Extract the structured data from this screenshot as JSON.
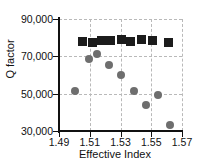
{
  "chart_data": {
    "type": "scatter",
    "title": "",
    "xlabel": "Effective Index",
    "ylabel": "Q factor",
    "xlim": [
      1.49,
      1.57
    ],
    "ylim": [
      30000,
      90000
    ],
    "xticks": [
      "1.49",
      "1.51",
      "1.53",
      "1.55",
      "1.57"
    ],
    "xtick_values": [
      1.49,
      1.51,
      1.53,
      1.55,
      1.57
    ],
    "yticks": [
      "30,000",
      "50,000",
      "70,000",
      "90,000"
    ],
    "ytick_values": [
      30000,
      50000,
      70000,
      90000
    ],
    "grid": true,
    "grid_style": "dashed",
    "legend": "none",
    "series": [
      {
        "name": "square-series",
        "marker": "square",
        "color": "#1c1c1c",
        "points": [
          {
            "x": 1.5055,
            "y": 78000
          },
          {
            "x": 1.5115,
            "y": 77200
          },
          {
            "x": 1.5175,
            "y": 78600
          },
          {
            "x": 1.5235,
            "y": 78400
          },
          {
            "x": 1.5305,
            "y": 79200
          },
          {
            "x": 1.5365,
            "y": 77800
          },
          {
            "x": 1.5435,
            "y": 78800
          },
          {
            "x": 1.5505,
            "y": 78600
          },
          {
            "x": 1.5615,
            "y": 77200
          }
        ]
      },
      {
        "name": "circle-series",
        "marker": "circle",
        "color": "#6e6e6e",
        "points": [
          {
            "x": 1.5005,
            "y": 51500
          },
          {
            "x": 1.5095,
            "y": 68500
          },
          {
            "x": 1.5145,
            "y": 71000
          },
          {
            "x": 1.5225,
            "y": 65500
          },
          {
            "x": 1.5305,
            "y": 60000
          },
          {
            "x": 1.5385,
            "y": 51500
          },
          {
            "x": 1.5465,
            "y": 44000
          },
          {
            "x": 1.5545,
            "y": 49500
          },
          {
            "x": 1.5625,
            "y": 33000
          }
        ]
      }
    ]
  }
}
